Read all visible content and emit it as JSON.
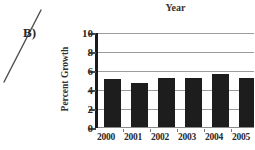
{
  "annotation": {
    "label": "B)"
  },
  "chart_data": {
    "type": "bar",
    "title": "Year",
    "xlabel": "",
    "ylabel": "Percent Growth",
    "categories": [
      "2000",
      "2001",
      "2002",
      "2003",
      "2004",
      "2005"
    ],
    "values": [
      5.1,
      4.6,
      5.2,
      5.2,
      5.6,
      5.2
    ],
    "ylim": [
      0,
      10
    ],
    "yticks": [
      0,
      2,
      4,
      6,
      8,
      10
    ],
    "grid": true,
    "legend": "none",
    "bar_color": "#1d1d1d",
    "gridline_color": "#9c9c9c",
    "axis_color": "#1a1a1a",
    "text_color": "#2a2a2a",
    "background_color": "#ffffff"
  }
}
